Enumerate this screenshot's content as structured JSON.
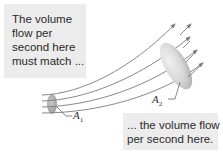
{
  "callouts": {
    "top": {
      "lines": [
        "The volume",
        "flow per",
        "second here",
        "must match ..."
      ]
    },
    "bottom": {
      "lines": [
        "... the volume flow",
        "per second here."
      ]
    }
  },
  "labels": {
    "a1": {
      "symbol": "A",
      "subscript": "1"
    },
    "a2": {
      "symbol": "A",
      "subscript": "2"
    }
  },
  "diagram": {
    "streamline_count": 4,
    "colors": {
      "streamline": "#7a7a7a",
      "cross_section_fill": "#b8b8b8",
      "callout_bg": "#ececec"
    }
  }
}
